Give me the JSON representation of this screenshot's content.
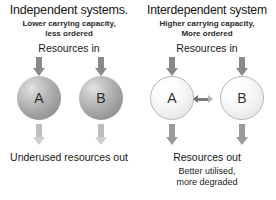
{
  "diagram": {
    "type": "conceptual-systems-diagram",
    "background_color": "#ffffff",
    "panels": [
      {
        "id": "independent",
        "title": "Independent systems.",
        "subtitle_line1": "Lower carrying capacity,",
        "subtitle_line2": "less ordered",
        "input_label": "Resources in",
        "nodes": [
          {
            "label": "A",
            "style": "dark-sphere"
          },
          {
            "label": "B",
            "style": "dark-sphere"
          }
        ],
        "linked": false,
        "input_arrow": {
          "direction": "down",
          "color": "#8a8a8a",
          "weight": "solid"
        },
        "output_arrow": {
          "direction": "down",
          "color": "#c4c4c4",
          "weight": "faded"
        },
        "output_label": "Underused resources out",
        "output_note_line1": "",
        "output_note_line2": ""
      },
      {
        "id": "interdependent",
        "title": "Interdependent system",
        "subtitle_line1": "Higher carrying capacity,",
        "subtitle_line2": "More ordered",
        "input_label": "Resources in",
        "nodes": [
          {
            "label": "A",
            "style": "light-sphere"
          },
          {
            "label": "B",
            "style": "light-sphere"
          }
        ],
        "linked": true,
        "link_arrow": {
          "direction": "bidirectional",
          "color": "#7d7d7d"
        },
        "input_arrow": {
          "direction": "down",
          "color": "#8a8a8a",
          "weight": "solid"
        },
        "output_arrow": {
          "direction": "down",
          "color": "#9a9a9a",
          "weight": "solid"
        },
        "output_label": "Resources out",
        "output_note_line1": "Better utilised,",
        "output_note_line2": "more degraded"
      }
    ]
  }
}
